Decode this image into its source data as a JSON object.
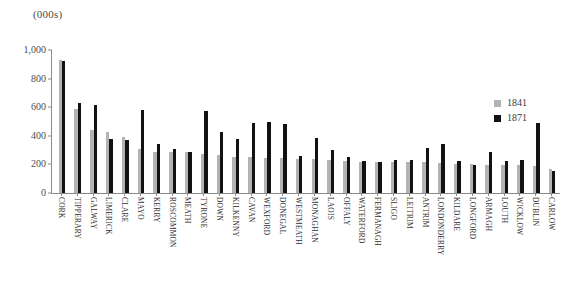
{
  "chart_data": {
    "type": "bar",
    "title": "",
    "subtitle": "",
    "xlabel": "",
    "ylabel": "(000s)",
    "ylim": [
      0,
      1000
    ],
    "ytick_labels": [
      "1,000",
      "800",
      "600",
      "400",
      "200",
      "0"
    ],
    "ytick_values": [
      1000,
      800,
      600,
      400,
      200,
      0
    ],
    "grid": false,
    "legend_position": "right",
    "categories": [
      "CORK",
      "TIPPERARY",
      "GALWAY",
      "LIMERICK",
      "CLARE",
      "MAYO",
      "KERRY",
      "ROSCOMMON",
      "MEATH",
      "TYRONE",
      "DOWN",
      "KILKENNY",
      "CAVAN",
      "WEXFORD",
      "DONEGAL",
      "WESTMEATH",
      "MONAGHAN",
      "LAOIS",
      "OFFALY",
      "WATERFORD",
      "FERMANAGH",
      "SLIGO",
      "LEITRIM",
      "ANTRIM",
      "LONDONDERRY",
      "KILDARE",
      "LONGFORD",
      "ARMAGH",
      "LOUTH",
      "WICKLOW",
      "DUBLIN",
      "CARLOW"
    ],
    "series": [
      {
        "name": "1841",
        "color": "#b3b3b3",
        "values": [
          930,
          590,
          440,
          425,
          395,
          305,
          290,
          290,
          290,
          275,
          265,
          250,
          250,
          245,
          245,
          240,
          235,
          230,
          225,
          220,
          215,
          215,
          215,
          215,
          210,
          205,
          200,
          195,
          195,
          195,
          190,
          170
        ]
      },
      {
        "name": "1871",
        "color": "#121212",
        "values": [
          925,
          630,
          615,
          380,
          370,
          580,
          340,
          305,
          290,
          575,
          425,
          380,
          490,
          495,
          480,
          260,
          385,
          300,
          250,
          225,
          215,
          230,
          230,
          315,
          340,
          225,
          195,
          290,
          225,
          230,
          490,
          155
        ]
      }
    ]
  },
  "legend": {
    "items": [
      {
        "label": "1841",
        "color": "#b3b3b3"
      },
      {
        "label": "1871",
        "color": "#121212"
      }
    ]
  }
}
